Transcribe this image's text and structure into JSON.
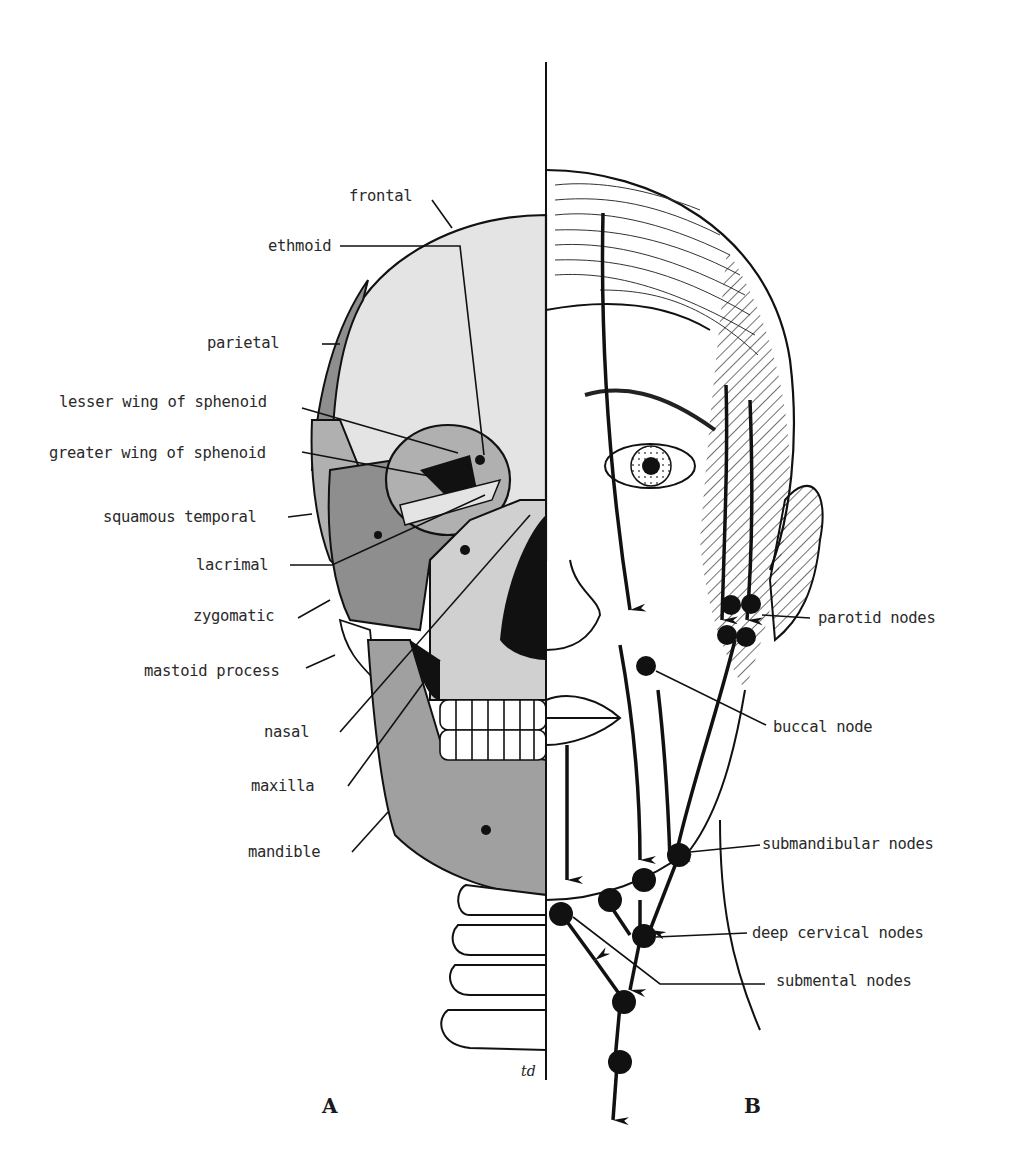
{
  "figure": {
    "panels": [
      {
        "id": "A",
        "label": "A",
        "description": "Bones of the skull (left half, frontal view)"
      },
      {
        "id": "B",
        "label": "B",
        "description": "Lymphatic drainage of the face and head (right half)"
      }
    ],
    "artist_signature": "td"
  },
  "panel_a": {
    "labels": [
      {
        "key": "frontal",
        "text": "frontal"
      },
      {
        "key": "ethmoid",
        "text": "ethmoid"
      },
      {
        "key": "parietal",
        "text": "parietal"
      },
      {
        "key": "lesser_wing_sphenoid",
        "text": "lesser wing of sphenoid"
      },
      {
        "key": "greater_wing_sphenoid",
        "text": "greater wing of sphenoid"
      },
      {
        "key": "squamous_temporal",
        "text": "squamous temporal"
      },
      {
        "key": "lacrimal",
        "text": "lacrimal"
      },
      {
        "key": "zygomatic",
        "text": "zygomatic"
      },
      {
        "key": "mastoid_process",
        "text": "mastoid process"
      },
      {
        "key": "nasal",
        "text": "nasal"
      },
      {
        "key": "maxilla",
        "text": "maxilla"
      },
      {
        "key": "mandible",
        "text": "mandible"
      }
    ]
  },
  "panel_b": {
    "labels": [
      {
        "key": "parotid_nodes",
        "text": "parotid nodes"
      },
      {
        "key": "buccal_node",
        "text": "buccal node"
      },
      {
        "key": "submandibular_nodes",
        "text": "submandibular nodes"
      },
      {
        "key": "deep_cervical_nodes",
        "text": "deep cervical nodes"
      },
      {
        "key": "submental_nodes",
        "text": "submental nodes"
      }
    ]
  },
  "colors": {
    "bone_light": "#e4e4e4",
    "bone_mid": "#b0b0b0",
    "bone_dark": "#8e8e8e",
    "ink": "#111111",
    "text": "#2a2a2a"
  }
}
